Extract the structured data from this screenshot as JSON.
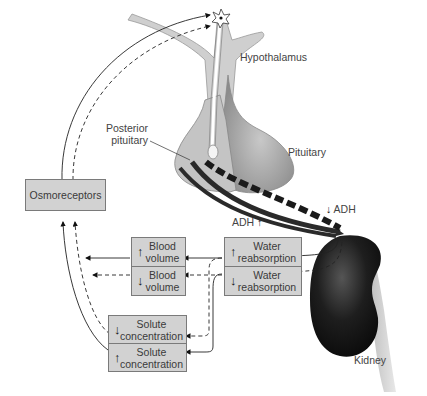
{
  "diagram": {
    "labels": {
      "hypothalamus": "Hypothalamus",
      "posterior_pituitary_line1": "Posterior",
      "posterior_pituitary_line2": "pituitary",
      "pituitary": "Pituitary",
      "kidney": "Kidney",
      "adh_increase": "ADH",
      "adh_increase_arrow": "↑",
      "adh_decrease": "ADH",
      "adh_decrease_arrow": "↓"
    },
    "boxes": {
      "osmoreceptors": "Osmoreceptors",
      "blood_volume_up": {
        "arrow": "↑",
        "line1": "Blood",
        "line2": "volume"
      },
      "blood_volume_down": {
        "arrow": "↓",
        "line1": "Blood",
        "line2": "volume"
      },
      "water_reabsorption_up": {
        "arrow": "↑",
        "line1": "Water",
        "line2": "reabsorption"
      },
      "water_reabsorption_down": {
        "arrow": "↓",
        "line1": "Water",
        "line2": "reabsorption"
      },
      "solute_concentration_down": {
        "arrow": "↓",
        "line1": "Solute",
        "line2": "concentration"
      },
      "solute_concentration_up": {
        "arrow": "↑",
        "line1": "Solute",
        "line2": "concentration"
      }
    },
    "legend_semantics": {
      "solid_line": "increased ADH pathway",
      "dashed_line": "decreased ADH pathway"
    },
    "colors": {
      "box_fill": "#d2d2d2",
      "box_border": "#7a7a7a",
      "tissue_light": "#cfcfcf",
      "tissue_dark": "#8a8a8a",
      "kidney": "#1a1a1a"
    }
  }
}
